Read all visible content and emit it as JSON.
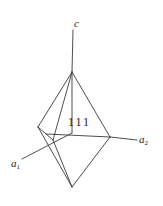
{
  "figure": {
    "kind": "crystallographic-axes-diagram",
    "width": 163,
    "height": 206,
    "background_color": "#ffffff",
    "line_color": "#3a3a3a",
    "text_color": "#1a1a1a"
  },
  "labels": {
    "axis_c": "c",
    "axis_a1_base": "a",
    "axis_a1_sub": "1",
    "axis_a2_base": "a",
    "axis_a2_sub": "2",
    "face_index": "111"
  },
  "geometry": {
    "vertices": {
      "apex_top": [
        72,
        72
      ],
      "apex_bottom": [
        72,
        187
      ],
      "vertex_left": [
        38,
        127
      ],
      "vertex_right": [
        110,
        137
      ],
      "vertex_front": [
        53,
        140
      ],
      "center": [
        72,
        133
      ]
    },
    "axis_endpoints": {
      "c_top": [
        74,
        28
      ],
      "c_bottom_at_apex": [
        72,
        72
      ],
      "a1_outer": [
        22,
        159
      ],
      "a1_inner": [
        72,
        133
      ],
      "a2_outer": [
        137,
        139
      ],
      "a2_inner": [
        110,
        137
      ]
    }
  }
}
